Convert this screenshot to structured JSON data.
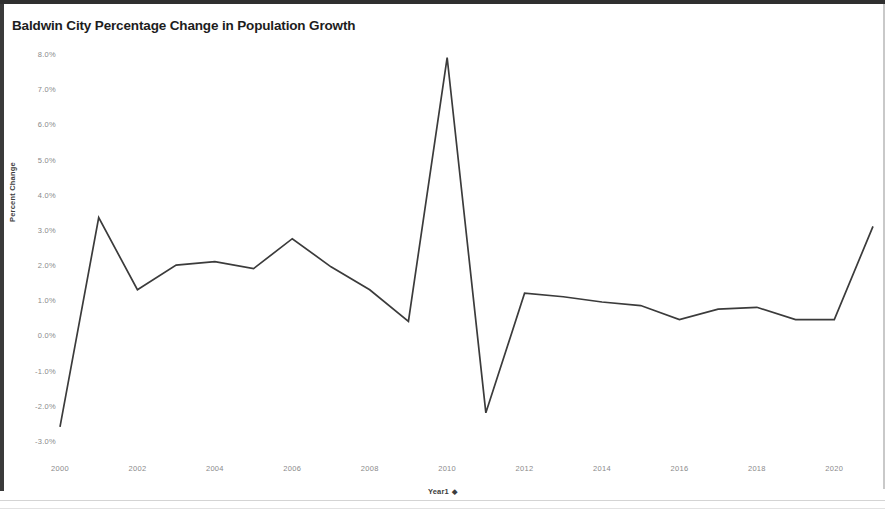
{
  "document": {
    "background_color": "#ffffff",
    "border_color": "#2f2f2f"
  },
  "chart": {
    "title": "Baldwin City Percentage Change in Population Growth",
    "line_color": "#3b3b3b",
    "tick_color": "#8a8a8a",
    "axis_title_color": "#3d3d3d",
    "x_axis_title": "Year1",
    "x_axis_sort_glyph": "sort-descending-icon",
    "x_axis_sort_char": "◆",
    "y_axis_title": "Percent Change"
  },
  "chart_data": {
    "type": "line",
    "title": "Baldwin City Percentage Change in Population Growth",
    "xlabel": "Year1",
    "ylabel": "Percent Change",
    "grid": false,
    "legend": false,
    "xlim": [
      2000,
      2021
    ],
    "ylim": [
      -3.0,
      8.0
    ],
    "ytick_labels": [
      "8.0%",
      "7.0%",
      "6.0%",
      "5.0%",
      "4.0%",
      "3.0%",
      "2.0%",
      "1.0%",
      "0.0%",
      "-1.0%",
      "-2.0%",
      "-3.0%"
    ],
    "ytick_values": [
      8.0,
      7.0,
      6.0,
      5.0,
      4.0,
      3.0,
      2.0,
      1.0,
      0.0,
      -1.0,
      -2.0,
      -3.0
    ],
    "xtick_labels": [
      "2000",
      "2002",
      "2004",
      "2006",
      "2008",
      "2010",
      "2012",
      "2014",
      "2016",
      "2018",
      "2020"
    ],
    "xtick_values": [
      2000,
      2002,
      2004,
      2006,
      2008,
      2010,
      2012,
      2014,
      2016,
      2018,
      2020
    ],
    "x": [
      2000,
      2001,
      2002,
      2003,
      2004,
      2005,
      2006,
      2007,
      2008,
      2009,
      2010,
      2011,
      2012,
      2013,
      2014,
      2015,
      2016,
      2017,
      2018,
      2019,
      2020,
      2021
    ],
    "values": [
      -2.6,
      3.35,
      1.3,
      2.0,
      2.1,
      1.9,
      2.75,
      1.95,
      1.3,
      0.4,
      7.9,
      -2.2,
      1.2,
      1.1,
      0.95,
      0.85,
      0.45,
      0.75,
      0.8,
      0.45,
      0.45,
      3.1
    ],
    "series": [
      {
        "name": "Percent Change",
        "color": "#3b3b3b",
        "values": [
          -2.6,
          3.35,
          1.3,
          2.0,
          2.1,
          1.9,
          2.75,
          1.95,
          1.3,
          0.4,
          7.9,
          -2.2,
          1.2,
          1.1,
          0.95,
          0.85,
          0.45,
          0.75,
          0.8,
          0.45,
          0.45,
          3.1
        ]
      }
    ]
  }
}
